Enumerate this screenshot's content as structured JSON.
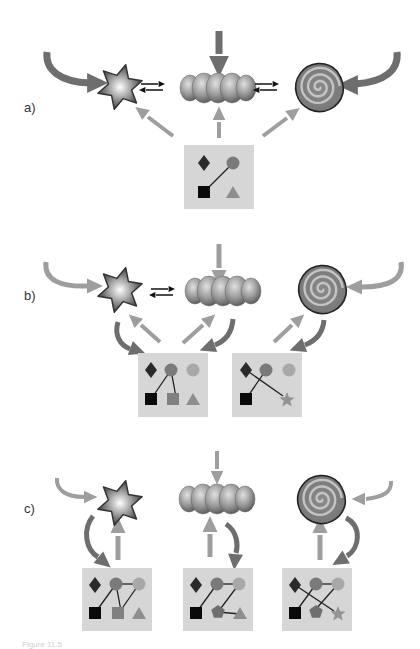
{
  "colors": {
    "background": "#ffffff",
    "box_fill": "#d6d6d6",
    "arrow_dark": "#6e6e6e",
    "arrow_light": "#9e9e9e",
    "arrow_black": "#111111",
    "diamond": "#2a2a2a",
    "square": "#0a0a0a",
    "circle_mid": "#7a7a7a",
    "circle_light": "#a8a8a8",
    "square_mid": "#808080",
    "triangle": "#8e8e8e",
    "pentagon": "#6f6f6f",
    "star_small": "#939393",
    "link": "#222222"
  },
  "panels": [
    {
      "id": "a",
      "label": "a)",
      "label_pos": [
        24,
        108
      ],
      "molecules": [
        {
          "type": "star",
          "x": 120,
          "y": 87
        },
        {
          "type": "beads",
          "x": 218,
          "y": 88
        },
        {
          "type": "spiral",
          "x": 319,
          "y": 87
        }
      ],
      "equilibria": [
        {
          "x": 152,
          "y": 87,
          "w": 22
        },
        {
          "x": 266,
          "y": 87,
          "w": 22
        }
      ],
      "boxes": [
        {
          "x": 184,
          "y": 145,
          "w": 70,
          "h": 64,
          "nodes": [
            {
              "shape": "diamond",
              "x": 204,
              "y": 163,
              "color": "diamond"
            },
            {
              "shape": "circle",
              "x": 233,
              "y": 163,
              "color": "circle_mid"
            },
            {
              "shape": "square",
              "x": 204,
              "y": 192,
              "color": "square"
            },
            {
              "shape": "triangle",
              "x": 233,
              "y": 193,
              "color": "triangle"
            }
          ],
          "links": [
            [
              204,
              192,
              233,
              163
            ]
          ]
        }
      ],
      "arrows": [
        {
          "kind": "curved",
          "style": "dark",
          "path": "M47,52 C45,70 60,82 90,83",
          "head": [
            95,
            83,
            0
          ],
          "w": 7
        },
        {
          "kind": "curved",
          "style": "dark",
          "path": "M397,52 C399,70 385,82 355,84",
          "head": [
            350,
            85,
            180
          ],
          "w": 7
        },
        {
          "kind": "straight",
          "style": "dark",
          "path": "M219,31 L219,54",
          "head": [
            219,
            64,
            90
          ],
          "w": 7
        },
        {
          "kind": "straight",
          "style": "light",
          "path": "M173,136 L148,117",
          "head": [
            142,
            112,
            217
          ],
          "w": 4
        },
        {
          "kind": "straight",
          "style": "light",
          "path": "M219,138 L219,122",
          "head": [
            219,
            115,
            270
          ],
          "w": 4
        },
        {
          "kind": "straight",
          "style": "light",
          "path": "M263,136 L287,118",
          "head": [
            293,
            113,
            323
          ],
          "w": 4
        }
      ]
    },
    {
      "id": "b",
      "label": "b)",
      "label_pos": [
        24,
        296
      ],
      "molecules": [
        {
          "type": "star",
          "x": 120,
          "y": 290
        },
        {
          "type": "beads",
          "x": 223,
          "y": 291
        },
        {
          "type": "spiral",
          "x": 322,
          "y": 289
        }
      ],
      "equilibria": [
        {
          "x": 162,
          "y": 292,
          "w": 22
        }
      ],
      "boxes": [
        {
          "x": 138,
          "y": 353,
          "w": 70,
          "h": 64,
          "nodes": [
            {
              "shape": "diamond",
              "x": 151,
              "y": 370,
              "color": "diamond"
            },
            {
              "shape": "circle",
              "x": 171,
              "y": 370,
              "color": "circle_mid"
            },
            {
              "shape": "circle",
              "x": 193,
              "y": 370,
              "color": "circle_light"
            },
            {
              "shape": "square",
              "x": 151,
              "y": 399,
              "color": "square"
            },
            {
              "shape": "square",
              "x": 173,
              "y": 399,
              "color": "square_mid"
            },
            {
              "shape": "triangle",
              "x": 193,
              "y": 400,
              "color": "triangle"
            }
          ],
          "links": [
            [
              151,
              399,
              171,
              370
            ],
            [
              171,
              370,
              176,
              397
            ]
          ]
        },
        {
          "x": 232,
          "y": 353,
          "w": 70,
          "h": 64,
          "nodes": [
            {
              "shape": "diamond",
              "x": 246,
              "y": 370,
              "color": "diamond"
            },
            {
              "shape": "circle",
              "x": 266,
              "y": 370,
              "color": "circle_mid"
            },
            {
              "shape": "circle",
              "x": 289,
              "y": 370,
              "color": "circle_light"
            },
            {
              "shape": "square",
              "x": 246,
              "y": 399,
              "color": "square"
            },
            {
              "shape": "star",
              "x": 287,
              "y": 400,
              "color": "star_small"
            }
          ],
          "links": [
            [
              246,
              399,
              266,
              370
            ],
            [
              246,
              370,
              283,
              396
            ]
          ]
        }
      ],
      "arrows": [
        {
          "kind": "curved",
          "style": "light",
          "path": "M46,262 C44,280 60,287 88,286",
          "head": [
            93,
            286,
            0
          ],
          "w": 5
        },
        {
          "kind": "curved",
          "style": "light",
          "path": "M401,262 C404,280 388,287 362,287",
          "head": [
            356,
            287,
            180
          ],
          "w": 5
        },
        {
          "kind": "straight",
          "style": "light",
          "path": "M219,244 L219,268",
          "head": [
            219,
            276,
            90
          ],
          "w": 5
        },
        {
          "kind": "curved",
          "style": "dark",
          "path": "M118,322 C114,335 120,345 130,349",
          "head": [
            136,
            350,
            20
          ],
          "w": 5
        },
        {
          "kind": "straight",
          "style": "light",
          "path": "M160,342 L141,325",
          "head": [
            135,
            320,
            222
          ],
          "w": 4
        },
        {
          "kind": "straight",
          "style": "light",
          "path": "M183,343 L203,325",
          "head": [
            209,
            320,
            318
          ],
          "w": 4
        },
        {
          "kind": "curved",
          "style": "dark",
          "path": "M233,319 C232,333 225,341 215,345",
          "head": [
            209,
            347,
            160
          ],
          "w": 5
        },
        {
          "kind": "straight",
          "style": "light",
          "path": "M274,342 L292,325",
          "head": [
            298,
            320,
            318
          ],
          "w": 4
        },
        {
          "kind": "curved",
          "style": "dark",
          "path": "M324,320 C323,333 315,341 305,345",
          "head": [
            299,
            347,
            160
          ],
          "w": 5
        }
      ]
    },
    {
      "id": "c",
      "label": "c)",
      "label_pos": [
        24,
        509
      ],
      "molecules": [
        {
          "type": "star",
          "x": 120,
          "y": 503
        },
        {
          "type": "beads",
          "x": 217,
          "y": 499
        },
        {
          "type": "spiral",
          "x": 321,
          "y": 499
        }
      ],
      "equilibria": [],
      "boxes": [
        {
          "x": 82,
          "y": 568,
          "w": 70,
          "h": 63,
          "nodes": [
            {
              "shape": "diamond",
              "x": 95,
              "y": 585,
              "color": "diamond"
            },
            {
              "shape": "circle",
              "x": 116,
              "y": 584,
              "color": "circle_mid"
            },
            {
              "shape": "circle",
              "x": 139,
              "y": 584,
              "color": "circle_light"
            },
            {
              "shape": "square",
              "x": 95,
              "y": 613,
              "color": "square"
            },
            {
              "shape": "square",
              "x": 118,
              "y": 613,
              "color": "square_mid"
            },
            {
              "shape": "triangle",
              "x": 139,
              "y": 614,
              "color": "triangle"
            }
          ],
          "links": [
            [
              95,
              613,
              116,
              584
            ],
            [
              116,
              584,
              139,
              584
            ],
            [
              116,
              584,
              121,
              611
            ],
            [
              121,
              610,
              139,
              584
            ]
          ]
        },
        {
          "x": 183,
          "y": 568,
          "w": 70,
          "h": 63,
          "nodes": [
            {
              "shape": "diamond",
              "x": 196,
              "y": 585,
              "color": "diamond"
            },
            {
              "shape": "circle",
              "x": 217,
              "y": 584,
              "color": "circle_mid"
            },
            {
              "shape": "circle",
              "x": 239,
              "y": 584,
              "color": "circle_light"
            },
            {
              "shape": "square",
              "x": 196,
              "y": 613,
              "color": "square"
            },
            {
              "shape": "pentagon",
              "x": 218,
              "y": 612,
              "color": "pentagon"
            },
            {
              "shape": "triangle",
              "x": 240,
              "y": 614,
              "color": "triangle"
            }
          ],
          "links": [
            [
              196,
              613,
              217,
              584
            ],
            [
              217,
              584,
              239,
              584
            ],
            [
              239,
              584,
              218,
              612
            ],
            [
              218,
              612,
              240,
              614
            ]
          ]
        },
        {
          "x": 282,
          "y": 568,
          "w": 70,
          "h": 63,
          "nodes": [
            {
              "shape": "diamond",
              "x": 295,
              "y": 585,
              "color": "diamond"
            },
            {
              "shape": "circle",
              "x": 316,
              "y": 584,
              "color": "circle_mid"
            },
            {
              "shape": "circle",
              "x": 338,
              "y": 584,
              "color": "circle_light"
            },
            {
              "shape": "square",
              "x": 295,
              "y": 613,
              "color": "square"
            },
            {
              "shape": "pentagon",
              "x": 316,
              "y": 612,
              "color": "pentagon"
            },
            {
              "shape": "star",
              "x": 338,
              "y": 614,
              "color": "star_small"
            }
          ],
          "links": [
            [
              295,
              613,
              316,
              584
            ],
            [
              316,
              584,
              338,
              584
            ],
            [
              295,
              585,
              334,
              611
            ],
            [
              338,
              584,
              316,
              609
            ]
          ]
        }
      ],
      "arrows": [
        {
          "kind": "curved",
          "style": "light",
          "path": "M57,478 C56,490 66,497 84,497",
          "head": [
            89,
            497,
            0
          ],
          "w": 4
        },
        {
          "kind": "curved",
          "style": "light",
          "path": "M391,481 C392,493 382,497 366,499",
          "head": [
            360,
            499,
            180
          ],
          "w": 4
        },
        {
          "kind": "straight",
          "style": "light",
          "path": "M217,451 L217,469",
          "head": [
            217,
            476,
            90
          ],
          "w": 4
        },
        {
          "kind": "curved",
          "style": "dark",
          "path": "M93,516 C82,530 86,550 98,557",
          "head": [
            103,
            561,
            40
          ],
          "w": 5
        },
        {
          "kind": "straight",
          "style": "light",
          "path": "M118,560 L118,536",
          "head": [
            118,
            527,
            270
          ],
          "w": 5
        },
        {
          "kind": "straight",
          "style": "light",
          "path": "M210,557 L210,534",
          "head": [
            210,
            526,
            270
          ],
          "w": 5
        },
        {
          "kind": "curved",
          "style": "dark",
          "path": "M226,524 C238,532 238,546 236,553",
          "head": [
            235,
            560,
            95
          ],
          "w": 5
        },
        {
          "kind": "straight",
          "style": "light",
          "path": "M320,560 L320,535",
          "head": [
            320,
            527,
            270
          ],
          "w": 5
        },
        {
          "kind": "curved",
          "style": "dark",
          "path": "M346,518 C362,526 360,548 347,556",
          "head": [
            341,
            560,
            150
          ],
          "w": 5
        }
      ]
    }
  ],
  "caption": "Figure 11.5"
}
